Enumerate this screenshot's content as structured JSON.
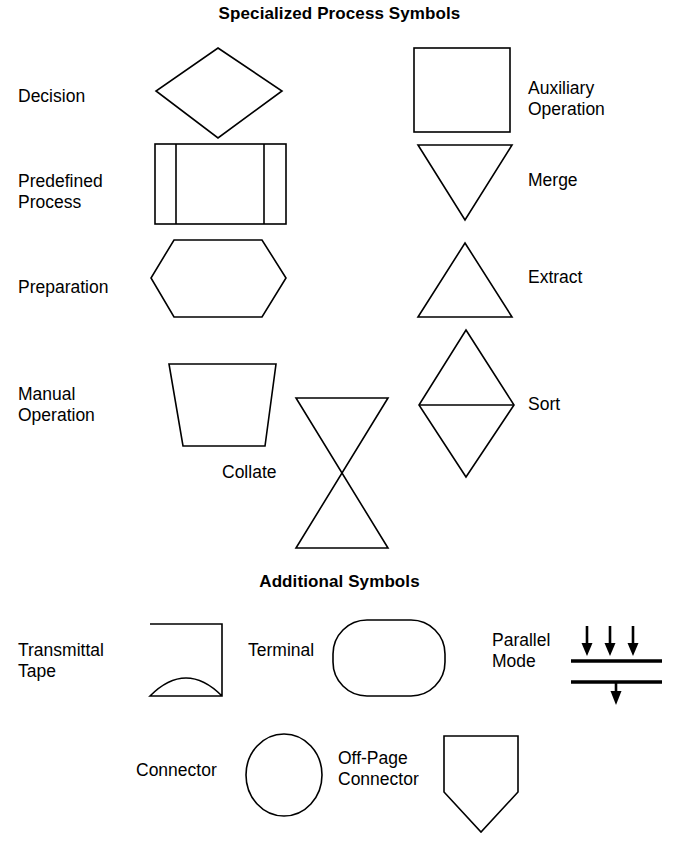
{
  "page": {
    "background_color": "#ffffff",
    "stroke_color": "#000000",
    "width": 679,
    "height": 846
  },
  "sections": [
    {
      "id": "specialized",
      "title": "Specialized Process Symbols"
    },
    {
      "id": "additional",
      "title": "Additional Symbols"
    }
  ],
  "specialized_symbols": [
    {
      "id": "decision",
      "label": "Decision",
      "shape": "diamond"
    },
    {
      "id": "predefined-process",
      "label": "Predefined\nProcess",
      "shape": "predefined-process"
    },
    {
      "id": "preparation",
      "label": "Preparation",
      "shape": "hexagon"
    },
    {
      "id": "manual-operation",
      "label": "Manual\nOperation",
      "shape": "trapezoid-down"
    },
    {
      "id": "collate",
      "label": "Collate",
      "shape": "hourglass"
    },
    {
      "id": "auxiliary-operation",
      "label": "Auxiliary\nOperation",
      "shape": "square"
    },
    {
      "id": "merge",
      "label": "Merge",
      "shape": "triangle-down"
    },
    {
      "id": "extract",
      "label": "Extract",
      "shape": "triangle-up"
    },
    {
      "id": "sort",
      "label": "Sort",
      "shape": "diamond-split"
    }
  ],
  "additional_symbols": [
    {
      "id": "transmittal-tape",
      "label": "Transmittal\nTape",
      "shape": "transmittal-tape"
    },
    {
      "id": "terminal",
      "label": "Terminal",
      "shape": "stadium"
    },
    {
      "id": "parallel-mode",
      "label": "Parallel\nMode",
      "shape": "parallel-bars"
    },
    {
      "id": "connector",
      "label": "Connector",
      "shape": "circle"
    },
    {
      "id": "off-page-connector",
      "label": "Off-Page\nConnector",
      "shape": "pentagon-down"
    }
  ]
}
